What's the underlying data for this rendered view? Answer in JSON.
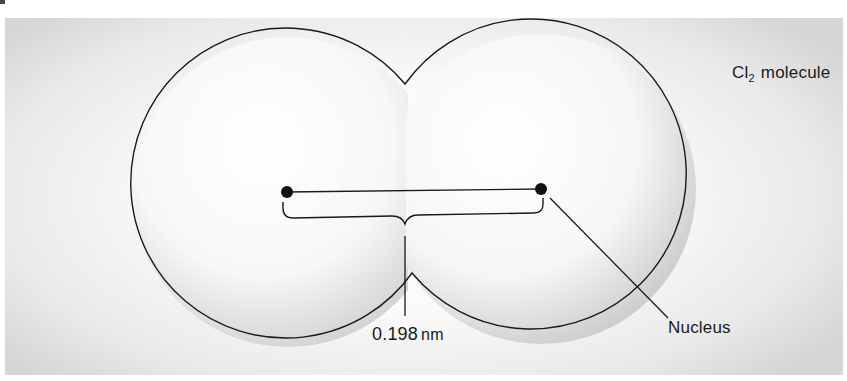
{
  "diagram": {
    "title": {
      "element": "Cl",
      "subscript": "2",
      "suffix": "molecule"
    },
    "labels": {
      "distance_value": "0.198",
      "distance_unit": "nm",
      "nucleus": "Nucleus"
    },
    "colors": {
      "outline": "#1a1a1a",
      "background_center": "#ffffff",
      "background_edge": "#d6d6d6",
      "atom_shade": "#c8c8c8"
    },
    "geometry": {
      "left_atom": {
        "cx": 288,
        "cy": 192,
        "r": 155
      },
      "right_atom": {
        "cx": 541,
        "cy": 189,
        "r": 155
      },
      "left_nucleus": {
        "x": 287,
        "y": 192
      },
      "right_nucleus": {
        "x": 541,
        "y": 189
      }
    }
  }
}
